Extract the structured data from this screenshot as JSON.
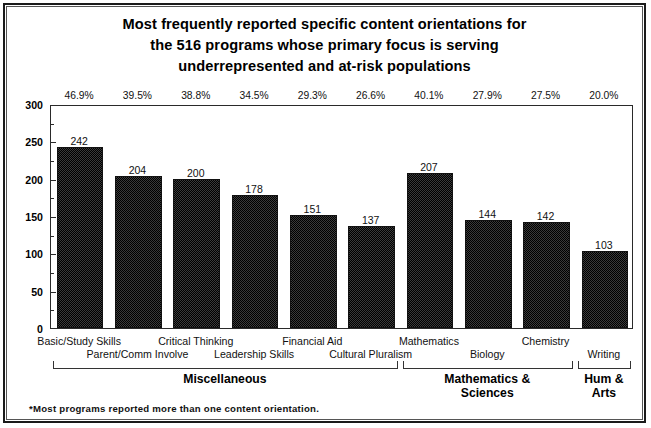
{
  "chart_data": {
    "type": "bar",
    "title": "Most frequently reported specific content orientations for the 516 programs whose primary focus is serving underrepresented and at-risk populations",
    "title_lines": [
      "Most frequently reported specific content orientations for",
      "the 516 programs whose primary focus is serving",
      "underrepresented and at-risk populations"
    ],
    "categories": [
      "Basic/Study Skills",
      "Parent/Comm Involve",
      "Critical Thinking",
      "Leadership Skills",
      "Financial Aid",
      "Cultural Pluralism",
      "Mathematics",
      "Biology",
      "Chemistry",
      "Writing"
    ],
    "values": [
      242,
      204,
      200,
      178,
      151,
      137,
      207,
      144,
      142,
      103
    ],
    "percent_labels": [
      "46.9%",
      "39.5%",
      "38.8%",
      "34.5%",
      "29.3%",
      "26.6%",
      "40.1%",
      "27.9%",
      "27.5%",
      "20.0%"
    ],
    "xlabel": "",
    "ylabel": "",
    "ylim": [
      0,
      300
    ],
    "ytick_labels": [
      "0",
      "50",
      "100",
      "150",
      "200",
      "250",
      "300"
    ],
    "ytick_values": [
      0,
      50,
      100,
      150,
      200,
      250,
      300
    ],
    "minor_tick_step": 25,
    "grid": false,
    "legend": "none",
    "bar_color": "#3a3a3a",
    "bar_edge_color": "#111111",
    "groups": [
      {
        "label": "Miscellaneous",
        "label_lines": "Miscellaneous",
        "members": 6
      },
      {
        "label": "Mathematics & Sciences",
        "label_lines": "Mathematics &\nSciences",
        "members": 3
      },
      {
        "label": "Hum & Arts",
        "label_lines": "Hum &\nArts",
        "members": 1
      }
    ],
    "footnote": "*Most programs reported more than one content orientation."
  }
}
